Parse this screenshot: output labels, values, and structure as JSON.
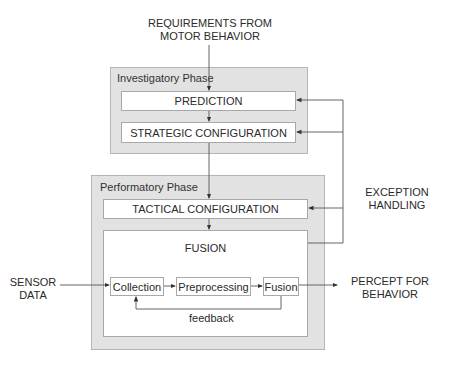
{
  "diagram": {
    "top_input": {
      "line1": "REQUIREMENTS FROM",
      "line2": "MOTOR BEHAVIOR"
    },
    "investigatory_phase": {
      "label": "Investigatory Phase",
      "boxes": [
        "PREDICTION",
        "STRATEGIC CONFIGURATION"
      ]
    },
    "performatory_phase": {
      "label": "Performatory Phase",
      "tactical": "TACTICAL CONFIGURATION",
      "fusion": {
        "title": "FUSION",
        "steps": [
          "Collection",
          "Preprocessing",
          "Fusion"
        ],
        "feedback_label": "feedback"
      }
    },
    "exception_handling": {
      "line1": "EXCEPTION",
      "line2": "HANDLING"
    },
    "sensor_input": {
      "line1": "SENSOR",
      "line2": "DATA"
    },
    "output": {
      "line1": "PERCEPT FOR",
      "line2": "BEHAVIOR"
    },
    "colors": {
      "phase_fill": "#e2e2e2",
      "box_fill": "#ffffff",
      "line": "#555555"
    }
  }
}
